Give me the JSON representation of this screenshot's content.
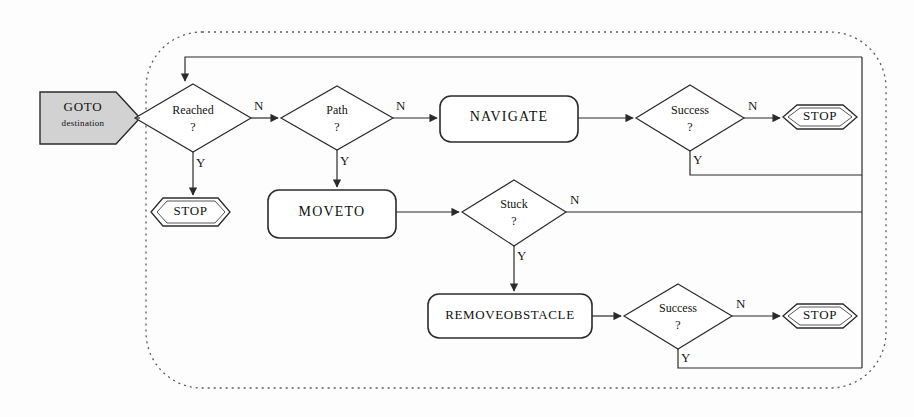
{
  "diagram": {
    "colors": {
      "line": "#2b2b2b",
      "goto_fill": "#d2d2d2",
      "node_fill": "#ffffff",
      "boundary": "#5a5a5a",
      "background": "#fdfdfd"
    },
    "boundary": {
      "style": "dotted-rounded-rectangle"
    },
    "nodes": [
      {
        "id": "goto",
        "type": "start-hexagon",
        "label": "GOTO",
        "sublabel": "destination"
      },
      {
        "id": "reached",
        "type": "decision",
        "label": "Reached",
        "label2": "?"
      },
      {
        "id": "stop1",
        "type": "terminator",
        "label": "STOP"
      },
      {
        "id": "path",
        "type": "decision",
        "label": "Path",
        "label2": "?"
      },
      {
        "id": "navigate",
        "type": "process",
        "label": "NAVIGATE"
      },
      {
        "id": "success1",
        "type": "decision",
        "label": "Success",
        "label2": "?"
      },
      {
        "id": "stop2",
        "type": "terminator",
        "label": "STOP"
      },
      {
        "id": "moveto",
        "type": "process",
        "label": "MOVETO"
      },
      {
        "id": "stuck",
        "type": "decision",
        "label": "Stuck",
        "label2": "?"
      },
      {
        "id": "removeobstacle",
        "type": "process",
        "label": "REMOVEOBSTACLE"
      },
      {
        "id": "success2",
        "type": "decision",
        "label": "Success",
        "label2": "?"
      },
      {
        "id": "stop3",
        "type": "terminator",
        "label": "STOP"
      }
    ],
    "branch_labels": {
      "reached_no": "N",
      "reached_yes": "Y",
      "path_no": "N",
      "path_yes": "Y",
      "success1_no": "N",
      "success1_yes": "Y",
      "stuck_no": "N",
      "stuck_yes": "Y",
      "success2_no": "N",
      "success2_yes": "Y"
    }
  }
}
